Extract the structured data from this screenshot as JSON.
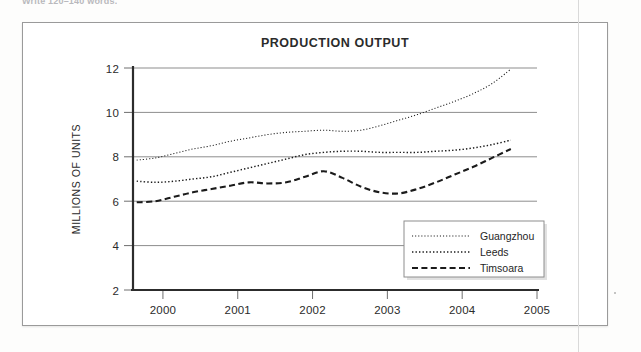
{
  "instruction_text": "Write 120–140 words.",
  "chart_data": {
    "type": "line",
    "title": "PRODUCTION OUTPUT",
    "xlabel": "",
    "ylabel": "MILLIONS OF UNITS",
    "xlim": [
      1999.6,
      2005.0
    ],
    "ylim": [
      2,
      12
    ],
    "yticks": [
      2,
      4,
      6,
      8,
      10,
      12
    ],
    "xticks": [
      2000,
      2001,
      2002,
      2003,
      2004,
      2005
    ],
    "ytick_labels": [
      "2",
      "4",
      "6",
      "8",
      "10",
      "12"
    ],
    "xtick_labels": [
      "2000",
      "2001",
      "2002",
      "2003",
      "2004",
      "2005"
    ],
    "grid": "horizontal",
    "legend_position": "bottom-right",
    "x": [
      1999.65,
      1999.9,
      2000.15,
      2000.4,
      2000.65,
      2000.9,
      2001.15,
      2001.4,
      2001.65,
      2001.9,
      2002.15,
      2002.4,
      2002.65,
      2002.9,
      2003.15,
      2003.4,
      2003.65,
      2003.9,
      2004.15,
      2004.4,
      2004.65
    ],
    "series": [
      {
        "name": "Guangzhou",
        "style": "fine-dotted",
        "values": [
          7.85,
          7.95,
          8.15,
          8.35,
          8.5,
          8.7,
          8.85,
          9.0,
          9.1,
          9.15,
          9.2,
          9.15,
          9.2,
          9.4,
          9.65,
          9.9,
          10.2,
          10.5,
          10.85,
          11.3,
          11.95
        ]
      },
      {
        "name": "Leeds",
        "style": "dotted",
        "values": [
          6.9,
          6.85,
          6.9,
          7.0,
          7.1,
          7.3,
          7.5,
          7.7,
          7.9,
          8.1,
          8.2,
          8.25,
          8.25,
          8.2,
          8.2,
          8.2,
          8.25,
          8.3,
          8.4,
          8.55,
          8.75
        ]
      },
      {
        "name": "Timsoara",
        "style": "dashed",
        "values": [
          5.95,
          6.0,
          6.2,
          6.4,
          6.55,
          6.7,
          6.85,
          6.8,
          6.85,
          7.1,
          7.35,
          7.05,
          6.65,
          6.4,
          6.35,
          6.55,
          6.85,
          7.2,
          7.55,
          7.95,
          8.35
        ]
      }
    ]
  }
}
